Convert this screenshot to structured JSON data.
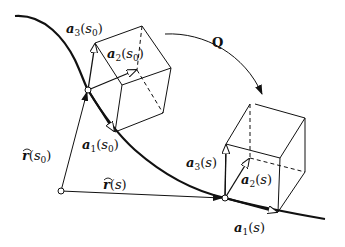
{
  "figure": {
    "labels": {
      "a3_s0": {
        "vec": "a",
        "sub": "3",
        "arg": "s",
        "argsub": "0"
      },
      "a2_s0": {
        "vec": "a",
        "sub": "2",
        "arg": "s",
        "argsub": "0"
      },
      "a1_s0": {
        "vec": "a",
        "sub": "1",
        "arg": "s",
        "argsub": "0"
      },
      "r_s0": {
        "vec": "r",
        "arg": "s",
        "argsub": "0"
      },
      "r_s": {
        "vec": "r",
        "arg": "s"
      },
      "a3_s": {
        "vec": "a",
        "sub": "3",
        "arg": "s"
      },
      "a2_s": {
        "vec": "a",
        "sub": "2",
        "arg": "s"
      },
      "a1_s": {
        "vec": "a",
        "sub": "1",
        "arg": "s"
      },
      "Q": "Q"
    },
    "text": {
      "open": "(",
      "close": ")",
      "hat": "^"
    },
    "colors": {
      "line": "#111111",
      "background": "#ffffff"
    }
  }
}
